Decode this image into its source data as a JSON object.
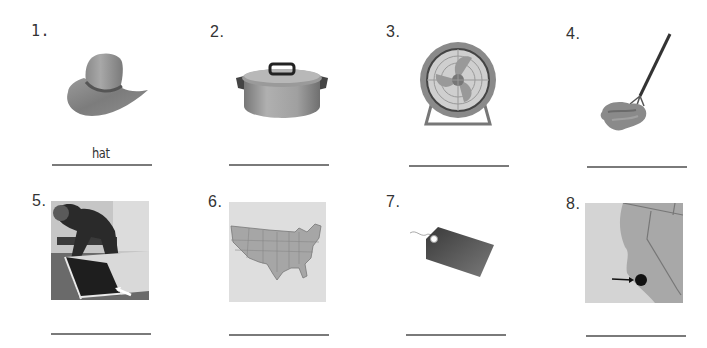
{
  "worksheet": {
    "items": [
      {
        "number": "1.",
        "picture": "cowboy-hat",
        "answer": "hat"
      },
      {
        "number": "2.",
        "picture": "cooking-pot",
        "answer": ""
      },
      {
        "number": "3.",
        "picture": "electric-fan",
        "answer": ""
      },
      {
        "number": "4.",
        "picture": "mop",
        "answer": ""
      },
      {
        "number": "5.",
        "picture": "man-making-bed-arrow-to-sheet",
        "answer": ""
      },
      {
        "number": "6.",
        "picture": "map-of-united-states",
        "answer": ""
      },
      {
        "number": "7.",
        "picture": "price-tag",
        "answer": ""
      },
      {
        "number": "8.",
        "picture": "california-map-with-dot",
        "answer": ""
      }
    ]
  },
  "colors": {
    "background": "#ffffff",
    "line": "#7a7a7a",
    "text": "#333333"
  }
}
